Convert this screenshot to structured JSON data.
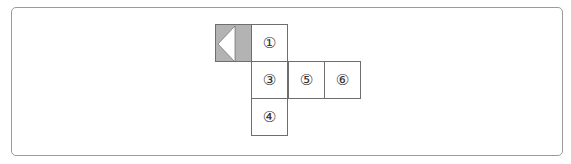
{
  "diagram": {
    "shaded_face": {
      "icon": "triangle-left-icon",
      "fill": "#b3b3b3",
      "triangle_fill": "#ffffff"
    },
    "faces": [
      {
        "label": "①",
        "col": 1,
        "row": 0
      },
      {
        "label": "③",
        "col": 1,
        "row": 1
      },
      {
        "label": "⑤",
        "col": 2,
        "row": 1
      },
      {
        "label": "⑥",
        "col": 3,
        "row": 1
      },
      {
        "label": "④",
        "col": 1,
        "row": 2
      }
    ]
  }
}
